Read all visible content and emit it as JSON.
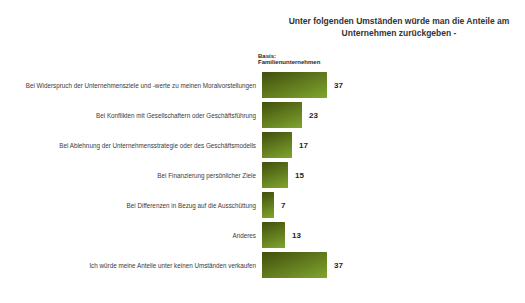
{
  "title_lines": [
    "Unter folgenden Umständen würde man die Anteile am",
    "Unternehmen zurückgeben -"
  ],
  "basis": {
    "line1": "Basis:",
    "line2": "Familienunternehmen"
  },
  "colors": {
    "bar_gradient_dark": "#414f0d",
    "bar_gradient_light": "#80a52e",
    "text": "#333333"
  },
  "chart_data": {
    "type": "bar",
    "orientation": "horizontal",
    "title": "Unter folgenden Umständen würde man die Anteile am Unternehmen zurückgeben -",
    "basis_note": "Basis: Familienunternehmen",
    "categories": [
      "Bei Widerspruch der Unternehmensziele und -werte zu meinen Moralvorstellungen",
      "Bei Konflikten mit Gesellschaftern oder Geschäftsführung",
      "Bei Ablehnung der Unternehmensstrategie oder des Geschäftsmodells",
      "Bei Finanzierung persönlicher Ziele",
      "Bei Differenzen in Bezug auf die Ausschüttung",
      "Anderes",
      "Ich würde meine Anteile unter keinen Umständen verkaufen"
    ],
    "values": [
      37,
      23,
      17,
      15,
      7,
      13,
      37
    ],
    "xlim": [
      0,
      40
    ],
    "value_labels_shown": true,
    "legend": "none",
    "grid": "off"
  }
}
